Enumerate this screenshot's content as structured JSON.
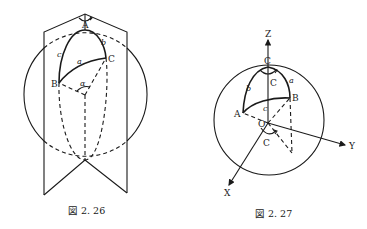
{
  "figures": [
    {
      "id": "fig-2-26",
      "caption": "図 2. 26",
      "points": {
        "A": "A",
        "B": "B",
        "C": "C"
      },
      "arcs": {
        "a": "a",
        "b": "b",
        "c": "c"
      },
      "angle": "α"
    },
    {
      "id": "fig-2-27",
      "caption": "図 2. 27",
      "axes": {
        "x": "X",
        "y": "Y",
        "z": "Z"
      },
      "origin": "O",
      "points": {
        "A": "A",
        "B": "B",
        "C": "C"
      },
      "arcs": {
        "a": "a",
        "b": "b",
        "c": "c"
      },
      "angle_top": "C",
      "angle_base": "C"
    }
  ]
}
